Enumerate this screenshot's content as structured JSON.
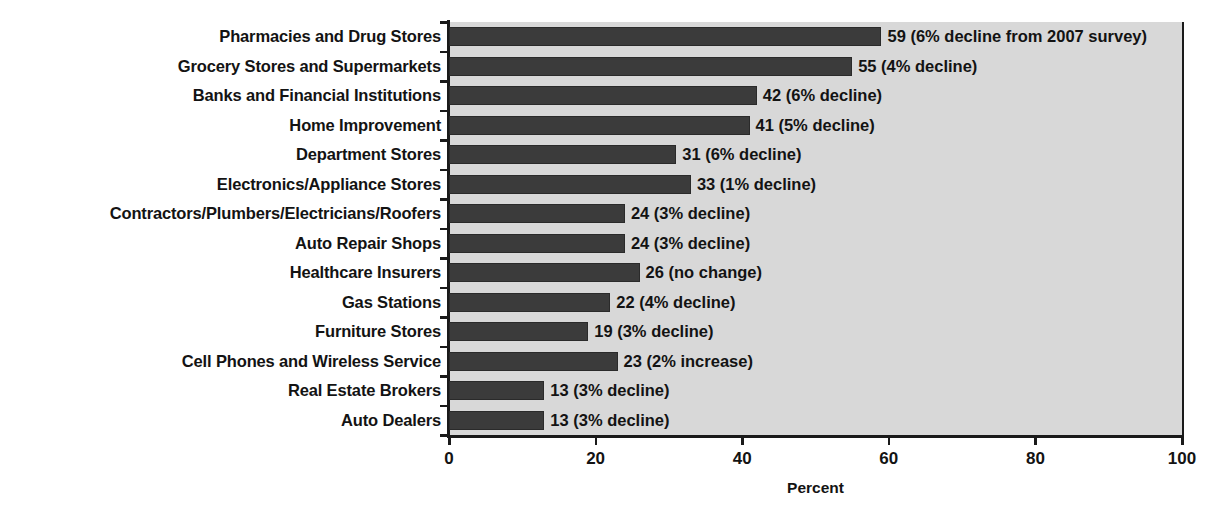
{
  "chart_data": {
    "type": "bar",
    "orientation": "horizontal",
    "title": "",
    "xlabel": "Percent",
    "ylabel": "",
    "xlim": [
      0,
      100
    ],
    "xticks": [
      0,
      20,
      40,
      60,
      80,
      100
    ],
    "xtick_labels": [
      "0",
      "20",
      "40",
      "60",
      "80",
      "100"
    ],
    "grid": false,
    "legend": false,
    "categories": [
      "Pharmacies and Drug Stores",
      "Grocery Stores and Supermarkets",
      "Banks and Financial Institutions",
      "Home Improvement",
      "Department Stores",
      "Electronics/Appliance Stores",
      "Contractors/Plumbers/Electricians/Roofers",
      "Auto Repair Shops",
      "Healthcare Insurers",
      "Gas Stations",
      "Furniture Stores",
      "Cell Phones and Wireless Service",
      "Real Estate Brokers",
      "Auto Dealers"
    ],
    "values": [
      59,
      55,
      42,
      41,
      31,
      33,
      24,
      24,
      26,
      22,
      19,
      23,
      13,
      13
    ],
    "data_labels": [
      "59 (6% decline from 2007 survey)",
      "55 (4% decline)",
      "42 (6% decline)",
      "41 (5% decline)",
      "31 (6% decline)",
      "33 (1% decline)",
      "24 (3% decline)",
      "24 (3% decline)",
      "26 (no change)",
      "22 (4% decline)",
      "19 (3% decline)",
      "23 (2% increase)",
      "13 (3% decline)",
      "13 (3% decline)"
    ],
    "colors": {
      "bar_fill": "#3b3b3b",
      "plot_background": "#d8d8d8",
      "axis": "#1a1a1a",
      "text": "#131313",
      "page_background": "#ffffff"
    }
  }
}
